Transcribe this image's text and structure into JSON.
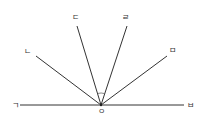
{
  "diagram": {
    "type": "angles-from-point-on-line",
    "center": {
      "label": "ㅇ",
      "x": 101,
      "y": 105
    },
    "rays": [
      {
        "label": "ㄱ",
        "end": [
          20,
          105
        ],
        "label_pos": [
          15,
          108
        ]
      },
      {
        "label": "ㄴ",
        "end": [
          36,
          56
        ],
        "label_pos": [
          27,
          54
        ]
      },
      {
        "label": "ㄷ",
        "end": [
          77,
          26
        ],
        "label_pos": [
          75,
          20
        ]
      },
      {
        "label": "ㄹ",
        "end": [
          127,
          26
        ],
        "label_pos": [
          125,
          20
        ]
      },
      {
        "label": "ㅁ",
        "end": [
          167,
          56
        ],
        "label_pos": [
          172,
          53
        ]
      },
      {
        "label": "ㅂ",
        "end": [
          184,
          105
        ],
        "label_pos": [
          190,
          108
        ]
      }
    ],
    "angle_mark": {
      "between": [
        "ㄷ",
        "ㄹ"
      ],
      "radius": 12
    },
    "colors": {
      "line": "#333333",
      "background": "#ffffff"
    }
  }
}
